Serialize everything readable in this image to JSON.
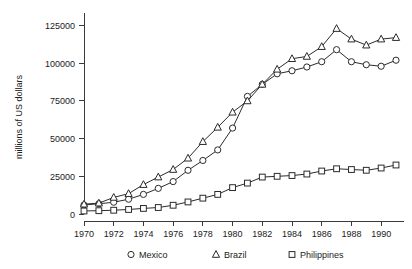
{
  "chart_data": {
    "type": "line",
    "title": "",
    "xlabel": "",
    "ylabel": "millions of US dollars",
    "xlim": [
      1970,
      1991
    ],
    "ylim": [
      0,
      130000
    ],
    "grid": false,
    "legend_position": "below-axis",
    "x_ticks": [
      1970,
      1972,
      1974,
      1976,
      1978,
      1980,
      1982,
      1984,
      1986,
      1988,
      1990
    ],
    "y_ticks": [
      0,
      25000,
      50000,
      75000,
      100000,
      125000
    ],
    "x": [
      1970,
      1971,
      1972,
      1973,
      1974,
      1975,
      1976,
      1977,
      1978,
      1979,
      1980,
      1981,
      1982,
      1983,
      1984,
      1985,
      1986,
      1987,
      1988,
      1989,
      1990,
      1991
    ],
    "series": [
      {
        "name": "Mexico",
        "marker": "circle",
        "values": [
          6000,
          6800,
          7800,
          9800,
          13000,
          17000,
          21500,
          29000,
          35500,
          42500,
          57000,
          78000,
          86000,
          93000,
          95000,
          97500,
          101000,
          109000,
          101000,
          99000,
          98000,
          102000
        ]
      },
      {
        "name": "Brazil",
        "marker": "triangle",
        "values": [
          6500,
          7200,
          11000,
          13500,
          19500,
          24500,
          29500,
          37000,
          48000,
          57500,
          67500,
          75000,
          86000,
          96000,
          103000,
          104500,
          111000,
          123000,
          116000,
          112000,
          116000,
          117000
        ]
      },
      {
        "name": "Philippines",
        "marker": "square",
        "values": [
          2000,
          2200,
          2500,
          3000,
          3700,
          4300,
          5800,
          8000,
          10500,
          13000,
          17500,
          20500,
          24500,
          25000,
          25500,
          26500,
          28500,
          30000,
          29500,
          29000,
          30500,
          32500
        ]
      }
    ],
    "legend": [
      {
        "label": "Mexico",
        "marker": "circle"
      },
      {
        "label": "Brazil",
        "marker": "triangle"
      },
      {
        "label": "Philippines",
        "marker": "square"
      }
    ]
  }
}
